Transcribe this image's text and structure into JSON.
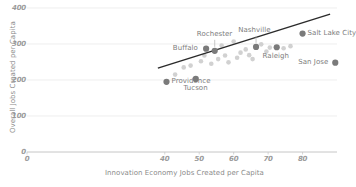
{
  "chart_data": {
    "type": "scatter",
    "title": "",
    "xlabel": "Innovation Economy Jobs Created per Capita",
    "ylabel": "Overall Jobs Created per Capita",
    "xlim": [
      0,
      90
    ],
    "ylim": [
      0,
      400
    ],
    "xticks": [
      "0",
      "40",
      "50",
      "60",
      "70",
      "80"
    ],
    "xtick_values": [
      0,
      40,
      50,
      60,
      70,
      80
    ],
    "yticks": [
      "400",
      "300",
      "200",
      "100",
      "0"
    ],
    "ytick_values": [
      400,
      300,
      200,
      100,
      0
    ],
    "grid": "horizontal",
    "legend": "none",
    "point_color": "#9a9a9a",
    "highlight_color": "#7a7a7a",
    "trendline_color": "#2b2b2b",
    "trendline": {
      "x0": 38,
      "y0": 233,
      "x1": 88,
      "y1": 383
    },
    "labeled_points": [
      {
        "name": "Providence",
        "x": 40.5,
        "y": 195,
        "label_side": "right"
      },
      {
        "name": "Tucson",
        "x": 49.0,
        "y": 203,
        "label_side": "below"
      },
      {
        "name": "Buffalo",
        "x": 52.0,
        "y": 287,
        "label_side": "left"
      },
      {
        "name": "Rochester",
        "x": 54.5,
        "y": 281,
        "label_side": "above"
      },
      {
        "name": "Nashville",
        "x": 66.5,
        "y": 292,
        "label_side": "above"
      },
      {
        "name": "Raleigh",
        "x": 72.5,
        "y": 291,
        "label_side": "below"
      },
      {
        "name": "Salt Lake City",
        "x": 80.0,
        "y": 329,
        "label_side": "right"
      },
      {
        "name": "San Jose",
        "x": 89.5,
        "y": 248,
        "label_side": "left"
      }
    ],
    "unlabeled_points": [
      {
        "x": 43.0,
        "y": 215
      },
      {
        "x": 45.5,
        "y": 235
      },
      {
        "x": 47.5,
        "y": 240
      },
      {
        "x": 50.5,
        "y": 252
      },
      {
        "x": 51.5,
        "y": 268
      },
      {
        "x": 53.5,
        "y": 245
      },
      {
        "x": 55.5,
        "y": 258
      },
      {
        "x": 56.5,
        "y": 296
      },
      {
        "x": 57.5,
        "y": 268
      },
      {
        "x": 58.5,
        "y": 249
      },
      {
        "x": 60.0,
        "y": 307
      },
      {
        "x": 61.0,
        "y": 262
      },
      {
        "x": 62.0,
        "y": 276
      },
      {
        "x": 63.5,
        "y": 285
      },
      {
        "x": 64.5,
        "y": 269
      },
      {
        "x": 65.5,
        "y": 258
      },
      {
        "x": 68.0,
        "y": 299
      },
      {
        "x": 69.5,
        "y": 279
      },
      {
        "x": 70.5,
        "y": 290
      },
      {
        "x": 74.5,
        "y": 288
      },
      {
        "x": 76.5,
        "y": 294
      }
    ]
  }
}
